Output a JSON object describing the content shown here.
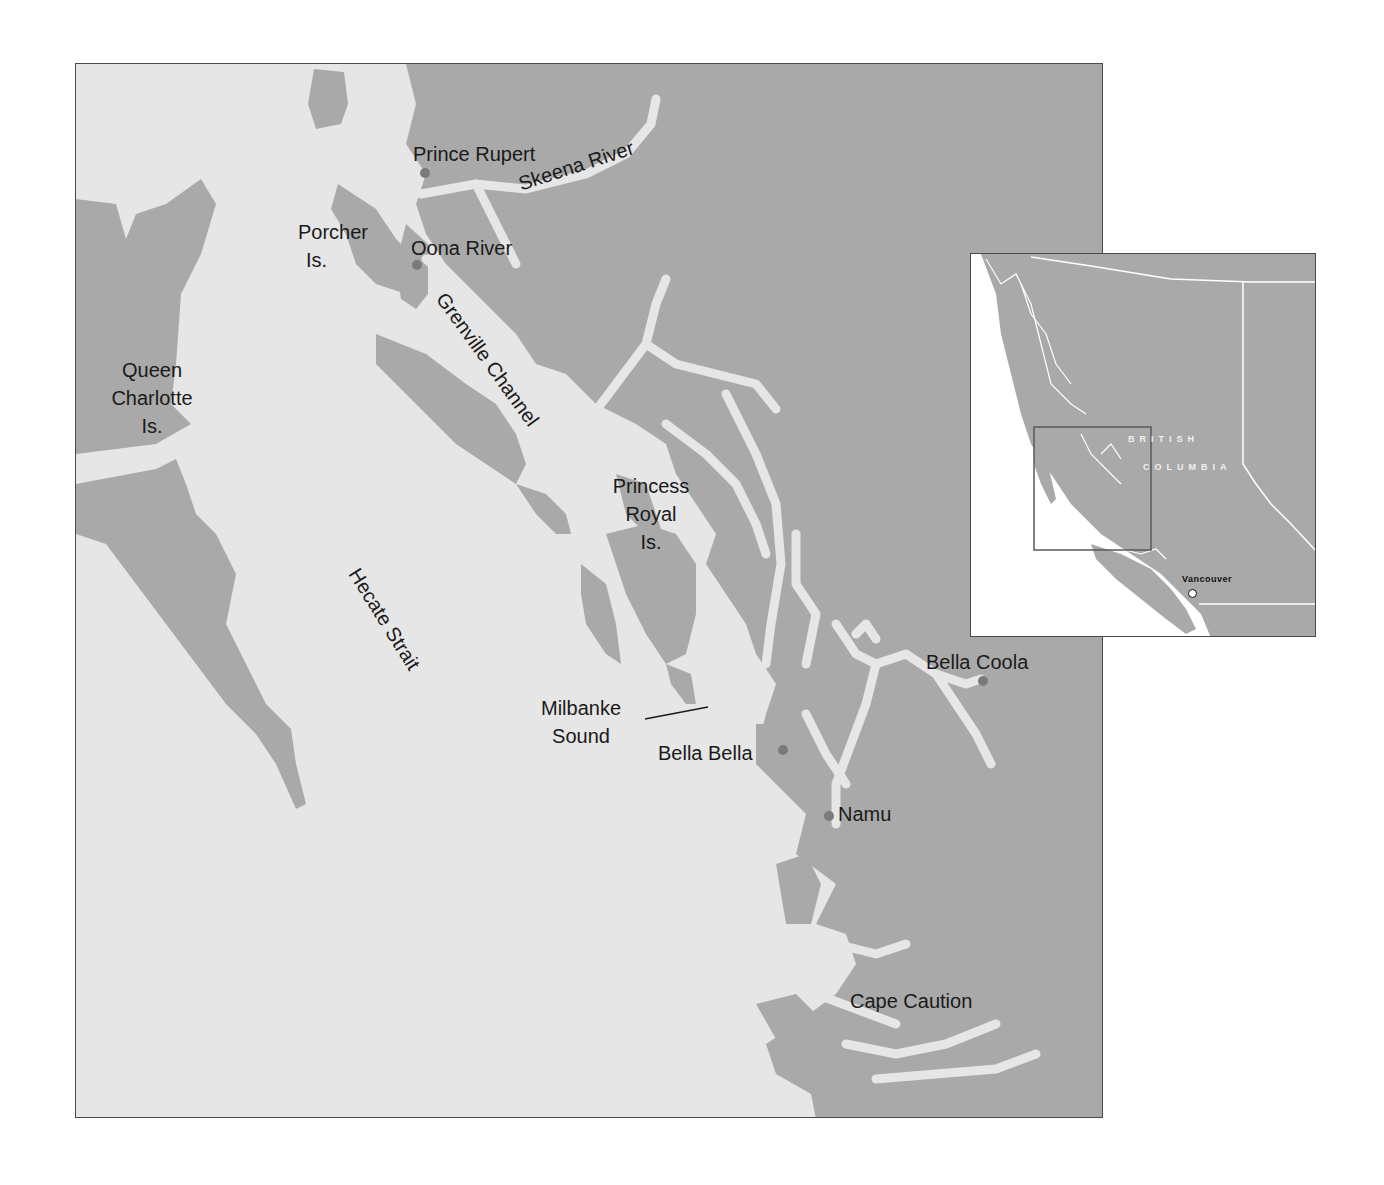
{
  "colors": {
    "land": "#a9a9a9",
    "water": "#e6e6e6",
    "border": "#4a4a4a",
    "settlement_dot": "#7a7a7a",
    "label_text": "#1a1a1a"
  },
  "main_map": {
    "settlements": [
      {
        "id": "prince-rupert",
        "label": "Prince Rupert"
      },
      {
        "id": "oona-river",
        "label": "Oona River"
      },
      {
        "id": "bella-coola",
        "label": "Bella Coola"
      },
      {
        "id": "bella-bella",
        "label": "Bella Bella"
      },
      {
        "id": "namu",
        "label": "Namu"
      },
      {
        "id": "cape-caution",
        "label": "Cape Caution"
      }
    ],
    "features": {
      "skeena_river": "Skeena River",
      "grenville_channel": "Grenville Channel",
      "hecate_strait": "Hecate Strait",
      "porcher_line1": "Porcher",
      "porcher_line2": "Is.",
      "queen_line1": "Queen",
      "queen_line2": "Charlotte",
      "queen_line3": "Is.",
      "princess_line1": "Princess",
      "princess_line2": "Royal",
      "princess_line3": "Is.",
      "milbanke_line1": "Milbanke",
      "milbanke_line2": "Sound"
    }
  },
  "inset_map": {
    "region_line1": "BRITISH",
    "region_line2": "COLUMBIA",
    "city": "Vancouver"
  }
}
